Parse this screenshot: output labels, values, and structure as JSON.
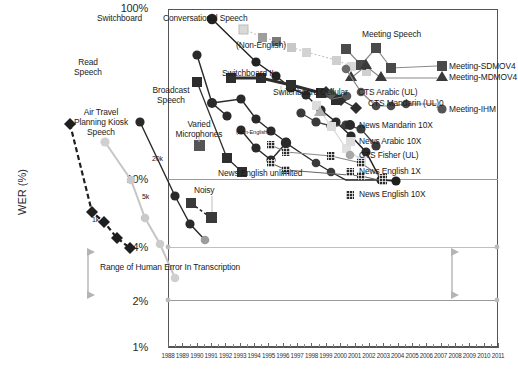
{
  "chart_data": {
    "type": "line",
    "title": "",
    "xlabel": "",
    "ylabel": "WER (%)",
    "xlim": [
      1988,
      2011
    ],
    "ylim": [
      1,
      100
    ],
    "yscale": "log",
    "grid": true,
    "legend_position": "right-inline",
    "ytick_labels": [
      "100%",
      "10%",
      "4%",
      "2%",
      "1%"
    ],
    "ytick_values": [
      100,
      10,
      4,
      2,
      1
    ],
    "xtick_labels": [
      "1988",
      "1989",
      "1990",
      "1991",
      "1992",
      "1993",
      "1994",
      "1995",
      "1996",
      "1997",
      "1998",
      "1999",
      "2000",
      "2001",
      "2002",
      "2003",
      "2004",
      "2005",
      "2006",
      "2007",
      "2008",
      "2009",
      "2010",
      "2011"
    ],
    "series": [
      {
        "name": "Switchboard",
        "marker": "circle",
        "color": "#222222",
        "style": "solid",
        "points": [
          [
            1993,
            88
          ],
          [
            1995,
            48
          ],
          [
            1996,
            38
          ],
          [
            1997,
            31
          ],
          [
            1999,
            26
          ],
          [
            2000,
            20.5
          ],
          [
            2001,
            17
          ],
          [
            2002,
            14.5
          ],
          [
            2003,
            11.2
          ],
          [
            2004,
            11.0
          ]
        ]
      },
      {
        "name": "Conversational Speech (Non-English)",
        "marker": "square",
        "color": "#b8b8b8",
        "style": "dotted",
        "points": [
          [
            1996,
            63
          ],
          [
            1997,
            56
          ],
          [
            1998,
            52
          ],
          [
            1999,
            46
          ],
          [
            2000,
            42
          ],
          [
            2002,
            37
          ],
          [
            2003,
            33
          ],
          [
            2004,
            30
          ]
        ]
      },
      {
        "name": "Switchboard II",
        "marker": "square",
        "color": "#333333",
        "style": "solid-thick",
        "points": [
          [
            1997,
            33
          ],
          [
            1998,
            33
          ],
          [
            2000,
            24
          ],
          [
            2001,
            21
          ],
          [
            2002,
            20.5
          ]
        ]
      },
      {
        "name": "Switchboard Cellular",
        "marker": "diamond",
        "color": "#333333",
        "style": "solid",
        "points": [
          [
            2000,
            26
          ],
          [
            2001,
            21.5
          ],
          [
            2002,
            19
          ]
        ]
      },
      {
        "name": "Read Speech",
        "marker": "square",
        "color": "#333333",
        "style": "solid",
        "points": [
          [
            1992,
            30
          ],
          [
            1994,
            12
          ],
          [
            1995,
            9.6
          ]
        ]
      },
      {
        "name": "Air Travel Planning Kiosk Speech",
        "marker": "diamond",
        "color": "#222222",
        "style": "dashed",
        "points": [
          [
            1988,
            20
          ],
          [
            1990,
            6.6
          ],
          [
            1991,
            6.0
          ],
          [
            1992,
            4.6
          ],
          [
            1993,
            3.6
          ]
        ]
      },
      {
        "name": "Broadcast Speech",
        "marker": "circle",
        "color": "#333333",
        "style": "solid",
        "points": [
          [
            1995,
            22
          ],
          [
            1996,
            18
          ],
          [
            1997,
            26
          ],
          [
            1998,
            17
          ],
          [
            1999,
            14
          ],
          [
            2000,
            13
          ],
          [
            2001,
            11.5
          ],
          [
            2002,
            9.6
          ]
        ]
      },
      {
        "name": "Varied Microphones",
        "marker": "square",
        "color": "#5a5a5a",
        "style": "solid",
        "points": [
          [
            1996,
            13
          ]
        ]
      },
      {
        "name": "Noisy",
        "marker": "square",
        "color": "#333333",
        "style": "dashed",
        "points": [
          [
            1996,
            7.0
          ],
          [
            1997,
            5.2
          ]
        ]
      },
      {
        "name": "News English unlimited",
        "marker": "circle",
        "color": "#2a2a2a",
        "style": "solid",
        "points": [
          [
            1998,
            11.5
          ],
          [
            1999,
            9.4
          ],
          [
            2000,
            10.5
          ],
          [
            2003,
            10.0
          ]
        ]
      },
      {
        "name": "News Mandarin 10X",
        "marker": "circle",
        "color": "#333333",
        "style": "solid",
        "points": [
          [
            2000,
            18
          ],
          [
            2001,
            16
          ],
          [
            2002,
            15.5
          ],
          [
            2003,
            13.8
          ],
          [
            2004,
            12.2
          ]
        ]
      },
      {
        "name": "News Arabic 10X",
        "marker": "square",
        "color": "#cfcfcf",
        "style": "solid",
        "points": [
          [
            2001,
            19
          ],
          [
            2002,
            17
          ],
          [
            2003,
            16
          ],
          [
            2004,
            13
          ]
        ]
      },
      {
        "name": "CTS Fisher (UL)",
        "marker": "circle",
        "color": "#b0b0b0",
        "style": "solid",
        "points": [
          [
            1992,
            16
          ],
          [
            1994,
            7.4
          ],
          [
            1995,
            4.2
          ],
          [
            1996,
            2.5
          ]
        ]
      },
      {
        "name": "News English 1X",
        "marker": "grid-square",
        "color": "#3a3a3a",
        "style": "solid",
        "points": [
          [
            1999,
            12
          ],
          [
            2000,
            11
          ],
          [
            2003,
            10.3
          ],
          [
            2004,
            10.2
          ]
        ]
      },
      {
        "name": "News English 10X",
        "marker": "grid-square",
        "color": "#2a2a2a",
        "style": "solid",
        "points": [
          [
            2000,
            13.5
          ],
          [
            2003,
            11.0
          ],
          [
            2004,
            10.5
          ]
        ]
      },
      {
        "name": "Meeting-SDMOV4",
        "marker": "square",
        "color": "#4a4a4a",
        "style": "solid",
        "points": [
          [
            2002,
            57
          ],
          [
            2003,
            48
          ],
          [
            2004,
            55
          ],
          [
            2005,
            47
          ]
        ]
      },
      {
        "name": "Meeting-MDMOV4",
        "marker": "triangle",
        "color": "#3a3a3a",
        "style": "solid",
        "points": [
          [
            2003,
            42
          ],
          [
            2004,
            46
          ],
          [
            2005,
            41
          ]
        ]
      },
      {
        "name": "Meeting-IHM",
        "marker": "circle",
        "color": "#555555",
        "style": "solid",
        "points": [
          [
            2002,
            31
          ],
          [
            2003,
            25
          ],
          [
            2004,
            24
          ],
          [
            2005,
            24
          ],
          [
            2006,
            25
          ]
        ]
      },
      {
        "name": "CTS Arabic (UL)",
        "marker": "circle",
        "color": "#555555",
        "style": "solid",
        "points": [
          [
            2003,
            28
          ],
          [
            2004,
            26
          ]
        ]
      },
      {
        "name": "CTS Mandarin (UL)",
        "marker": "circle",
        "color": "#666666",
        "style": "solid",
        "points": [
          [
            2004,
            24
          ],
          [
            2005,
            23
          ]
        ]
      }
    ],
    "annotations": [
      {
        "id": "switchboard",
        "text": "Switchboard"
      },
      {
        "id": "conversational-speech",
        "text": "Conversational Speech"
      },
      {
        "id": "non-english-top",
        "text": "(Non-English)"
      },
      {
        "id": "non-english-mid",
        "text": "(Non-English)"
      },
      {
        "id": "read-speech",
        "text": "Read\nSpeech"
      },
      {
        "id": "broadcast-speech",
        "text": "Broadcast\nSpeech"
      },
      {
        "id": "switchboard-ii",
        "text": "Switchboard II"
      },
      {
        "id": "switchboard-cellular",
        "text": "Switchboard Cellular"
      },
      {
        "id": "meeting-speech",
        "text": "Meeting Speech"
      },
      {
        "id": "air-travel",
        "text": "Air Travel\nPlanning Kiosk\nSpeech"
      },
      {
        "id": "varied-microphones",
        "text": "Varied\nMicrophones"
      },
      {
        "id": "news-english-unlimited",
        "text": "News English unlimited"
      },
      {
        "id": "noisy",
        "text": "Noisy"
      },
      {
        "id": "label-20k",
        "text": "20k"
      },
      {
        "id": "label-5k",
        "text": "5k"
      },
      {
        "id": "label-1k",
        "text": "1k"
      },
      {
        "id": "human-error-range",
        "text": "Range of Human Error In Transcription"
      }
    ],
    "legend_entries": [
      {
        "label": "Meeting-SDMOV4",
        "marker": "square",
        "color": "#4a4a4a"
      },
      {
        "label": "Meeting-MDMOV4",
        "marker": "triangle",
        "color": "#3a3a3a"
      },
      {
        "label": "Meeting-IHM",
        "marker": "circle",
        "color": "#555555"
      },
      {
        "label": "News Mandarin 10X",
        "marker": "circle",
        "color": "#2a2a2a"
      },
      {
        "label": "News Arabic 10X",
        "marker": "square",
        "color": "#d5d5d5"
      },
      {
        "label": "CTS Fisher (UL)",
        "marker": "circle",
        "color": "#a8a8a8"
      },
      {
        "label": "News English 1X",
        "marker": "grid-square",
        "color": "#3a3a3a"
      },
      {
        "label": "News English 10X",
        "marker": "grid-square",
        "color": "#2a2a2a"
      }
    ],
    "inline_labels": [
      {
        "label": "CTS Arabic (UL)"
      },
      {
        "label": "CTS Mandarin (UL)0"
      }
    ]
  },
  "axes": {
    "y_title": "WER (%)",
    "y_100": "100%",
    "y_10": "10%",
    "y_4": "4%",
    "y_2": "2%",
    "y_1": "1%"
  },
  "annotations": {
    "switchboard": "Switchboard",
    "conversational_speech": "Conversational Speech",
    "non_english_top": "(Non-English)",
    "non_english_mid": "(Non-English)",
    "read_speech_l1": "Read",
    "read_speech_l2": "Speech",
    "broadcast_l1": "Broadcast",
    "broadcast_l2": "Speech",
    "switchboard_ii": "Switchboard II",
    "switchboard_cellular": "Switchboard Cellular",
    "meeting_speech": "Meeting Speech",
    "air_travel_l1": "Air Travel",
    "air_travel_l2": "Planning Kiosk",
    "air_travel_l3": "Speech",
    "varied_mic_l1": "Varied",
    "varied_mic_l2": "Microphones",
    "news_english_unlimited": "News English unlimited",
    "noisy": "Noisy",
    "k20": "20k",
    "k5": "5k",
    "k1": "1k",
    "human_error": "Range of Human Error In Transcription",
    "cts_arabic": "CTS Arabic (UL)",
    "cts_mandarin": "CTS Mandarin (UL)0"
  },
  "legend": {
    "e0": "Meeting-SDMOV4",
    "e1": "Meeting-MDMOV4",
    "e2": "Meeting-IHM",
    "e3": "News Mandarin 10X",
    "e4": "News Arabic 10X",
    "e5": "CTS Fisher (UL)",
    "e6": "News English 1X",
    "e7": "News English 10X"
  },
  "xaxis": {
    "t0": "1988",
    "t1": "1989",
    "t2": "1990",
    "t3": "1991",
    "t4": "1992",
    "t5": "1993",
    "t6": "1994",
    "t7": "1995",
    "t8": "1996",
    "t9": "1997",
    "t10": "1998",
    "t11": "1999",
    "t12": "2000",
    "t13": "2001",
    "t14": "2002",
    "t15": "2003",
    "t16": "2004",
    "t17": "2005",
    "t18": "2006",
    "t19": "2007",
    "t20": "2008",
    "t21": "2009",
    "t22": "2010",
    "t23": "2011"
  }
}
